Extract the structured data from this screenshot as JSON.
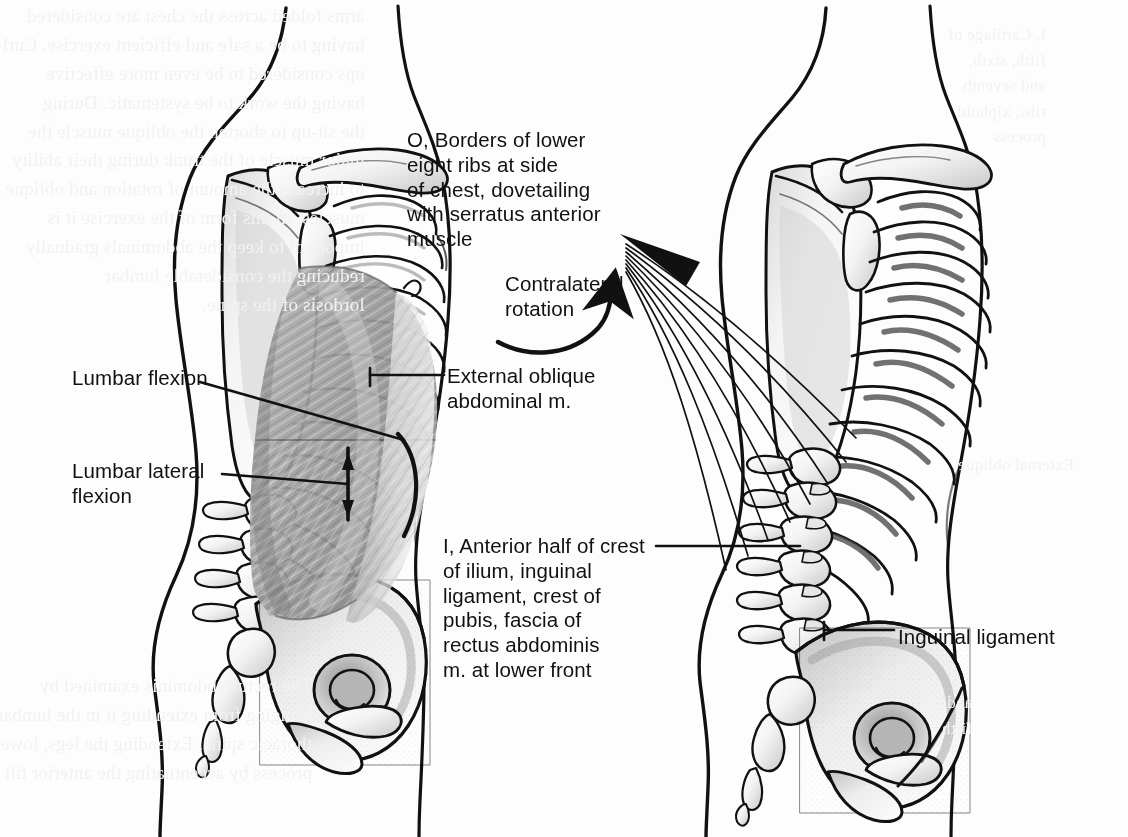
{
  "plate": {
    "subject": "external-oblique-abdominal-muscle",
    "background_color": "#fdfdfd",
    "ink_color": "#111111",
    "muscle_fill_color": "#9a9a9a",
    "bone_fill_color": "#f4f4f4",
    "ghost_text_color": "#f2f2f2",
    "view": "lateral",
    "figures": [
      {
        "id": "left",
        "name": "muscle-figure",
        "description": "Lateral torso with external oblique abdominal muscle in place over rib cage and pelvis"
      },
      {
        "id": "right",
        "name": "skeleton-figure",
        "description": "Lateral torso skeleton showing attachment sites on lower eight ribs, iliac crest and inguinal ligament"
      }
    ]
  },
  "labels": {
    "origin": "O, Borders of lower\neight ribs at side\nof chest, dovetailing\nwith serratus anterior\nmuscle",
    "rotation": "Contralateral\nrotation",
    "external_oblique": "External oblique\nabdominal m.",
    "insertion": "I, Anterior half of crest\nof ilium, inguinal\nligament, crest of\npubis, fascia of\nrectus abdominis\nm. at lower front",
    "inguinal_ligament": "Inguinal ligament",
    "lumbar_flexion": "Lumbar flexion",
    "lumbar_lateral_flexion": "Lumbar lateral\nflexion"
  },
  "showthrough": {
    "note": "faint mirrored bleed-through of body text printed on the reverse of the page",
    "left_column": "arms folded across the chest are considered\nhaving to be a safe and efficient exercise. Curl-\nups considered to be even more effective\nhaving the work to be systematic. During\nthe sit-up to shorten the oblique muscle the\nmajor muscle of the trunk during their ability\nto increase the amount of rotation and oblique\nmuscles. In this form of the exercise it is\nimportant to keep the abdominals gradually\nreducing the considerable lumbar\nlordosis of the spine.",
    "left_lower": "The rectus abdominis examined by\nbringing from extending it in the lumbar\nthoracic spine. Extending the legs, lower\nprocess by accentuating the anterior tilt",
    "top_right": "I, Cartilage of\nfifth, sixth,\nand seventh\nribs, xiphoid\nprocess",
    "mid_right": "External oblique",
    "bottom_right": "and of\nfifth"
  }
}
